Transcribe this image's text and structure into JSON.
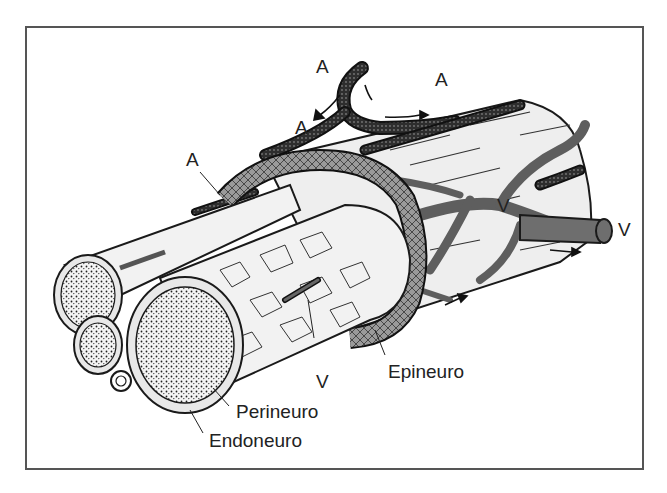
{
  "figure": {
    "colors": {
      "frame": "#555555",
      "outline": "#1a1a1a",
      "fascicle_fill": "#f2f2f2",
      "artery_fill": "#3a3a3a",
      "vein_fill": "#6e6e6e",
      "epineurium_fill": "#8a8a8a",
      "background": "#ffffff"
    }
  },
  "labels": {
    "artery_top_left": "A",
    "artery_top_right": "A",
    "artery_mid": "A",
    "artery_left": "A",
    "vein_right_inner": "V",
    "vein_right_outer": "V",
    "vein_bottom": "V",
    "epineurium": "Epineuro",
    "perineurium": "Perineuro",
    "endoneurium": "Endoneuro"
  }
}
